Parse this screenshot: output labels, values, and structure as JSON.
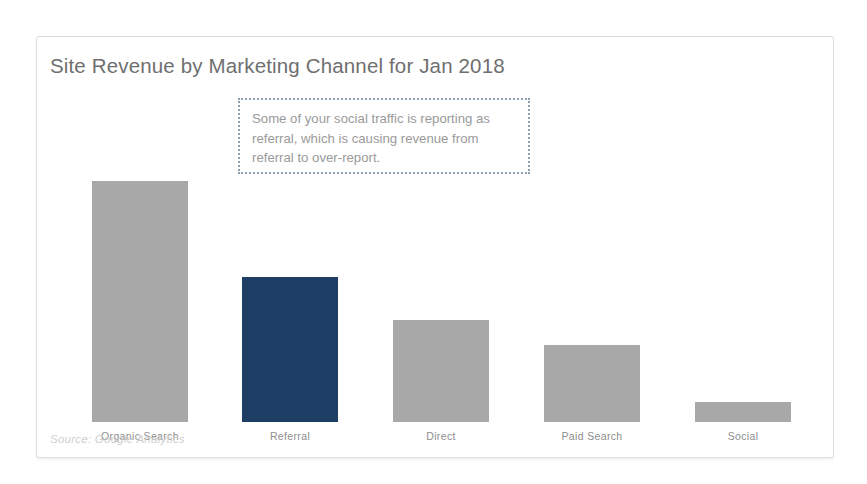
{
  "card": {
    "border_color": "#dcdcdc",
    "background": "#ffffff"
  },
  "title": "Site Revenue by Marketing Channel for Jan 2018",
  "annotation": {
    "text": "Some of your social traffic is reporting as referral, which is causing revenue from referral to over-report.",
    "border_color": "#8f9fb3",
    "text_color": "#9a9a9a"
  },
  "source_note": "Source: Google Analytics",
  "colors": {
    "bar_default": "#a8a8a8",
    "bar_highlight": "#1f3e66",
    "title": "#6f6f6f",
    "axis_label": "#8e8e8e",
    "source": "#cfcfcf"
  },
  "chart_data": {
    "type": "bar",
    "title": "Site Revenue by Marketing Channel for Jan 2018",
    "xlabel": "",
    "ylabel": "",
    "grid": false,
    "legend": null,
    "axis_visible": false,
    "ylim": [
      0,
      250
    ],
    "categories": [
      "Organic Search",
      "Referral",
      "Direct",
      "Paid Search",
      "Social"
    ],
    "values": [
      241,
      145,
      102,
      77,
      20
    ],
    "value_unit": "pixel-height",
    "bar_colors": [
      "#a8a8a8",
      "#1f3e66",
      "#a8a8a8",
      "#a8a8a8",
      "#a8a8a8"
    ],
    "highlighted_category": "Referral",
    "annotations": [
      {
        "text": "Some of your social traffic is reporting as referral, which is causing revenue from referral to over-report.",
        "style": "dotted-box"
      }
    ],
    "bars": [
      {
        "label": "Organic Search",
        "value": 241,
        "color": "#a8a8a8",
        "left": 55
      },
      {
        "label": "Referral",
        "value": 145,
        "color": "#1f3e66",
        "left": 205
      },
      {
        "label": "Direct",
        "value": 102,
        "color": "#a8a8a8",
        "left": 356
      },
      {
        "label": "Paid Search",
        "value": 77,
        "color": "#a8a8a8",
        "left": 507
      },
      {
        "label": "Social",
        "value": 20,
        "color": "#a8a8a8",
        "left": 658
      }
    ]
  }
}
